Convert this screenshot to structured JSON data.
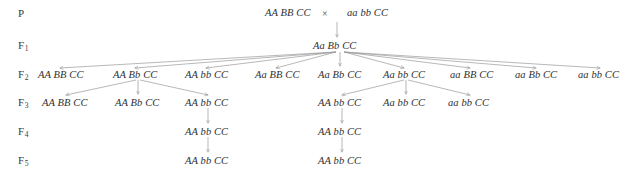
{
  "diagram": {
    "background": "#ffffff",
    "text_color": "#2f2f2f",
    "line_color": "#9a9a9a",
    "cross_symbol": "×",
    "generations": [
      {
        "label": "P",
        "sub": ""
      },
      {
        "label": "F",
        "sub": "1"
      },
      {
        "label": "F",
        "sub": "2"
      },
      {
        "label": "F",
        "sub": "3"
      },
      {
        "label": "F",
        "sub": "4"
      },
      {
        "label": "F",
        "sub": "5"
      }
    ],
    "rows": {
      "P": {
        "items": [
          {
            "text": "AA BB CC",
            "x": 265,
            "y": 7
          },
          {
            "text": "aa bb CC",
            "x": 347,
            "y": 7
          }
        ],
        "cross": {
          "text": "×",
          "x": 322,
          "y": 8
        }
      },
      "F1": {
        "items": [
          {
            "text": "Aa Bb CC",
            "x": 313,
            "y": 40
          }
        ]
      },
      "F2": {
        "items": [
          {
            "text": "AA BB CC",
            "x": 38,
            "y": 69
          },
          {
            "text": "AA Bb CC",
            "x": 113,
            "y": 69
          },
          {
            "text": "AA bb CC",
            "x": 185,
            "y": 69
          },
          {
            "text": "Aa BB CC",
            "x": 255,
            "y": 69
          },
          {
            "text": "Aa Bb CC",
            "x": 318,
            "y": 69
          },
          {
            "text": "Aa bb CC",
            "x": 383,
            "y": 69
          },
          {
            "text": "aa BB CC",
            "x": 450,
            "y": 69
          },
          {
            "text": "aa Bb CC",
            "x": 515,
            "y": 69
          },
          {
            "text": "aa bb CC",
            "x": 578,
            "y": 69
          }
        ]
      },
      "F3": {
        "items": [
          {
            "text": "AA BB CC",
            "x": 42,
            "y": 97
          },
          {
            "text": "AA Bb CC",
            "x": 115,
            "y": 97
          },
          {
            "text": "AA bb CC",
            "x": 185,
            "y": 97
          },
          {
            "text": "AA bb CC",
            "x": 318,
            "y": 97
          },
          {
            "text": "Aa bb CC",
            "x": 383,
            "y": 97
          },
          {
            "text": "aa bb CC",
            "x": 448,
            "y": 97
          }
        ]
      },
      "F4": {
        "items": [
          {
            "text": "AA bb CC",
            "x": 185,
            "y": 126
          },
          {
            "text": "AA bb CC",
            "x": 318,
            "y": 126
          }
        ]
      },
      "F5": {
        "items": [
          {
            "text": "AA bb CC",
            "x": 185,
            "y": 155
          },
          {
            "text": "AA bb CC",
            "x": 318,
            "y": 155
          }
        ]
      }
    },
    "label_positions": [
      {
        "x": 18,
        "y": 7
      },
      {
        "x": 18,
        "y": 39
      },
      {
        "x": 18,
        "y": 68
      },
      {
        "x": 18,
        "y": 96
      },
      {
        "x": 18,
        "y": 125
      },
      {
        "x": 18,
        "y": 154
      }
    ]
  }
}
